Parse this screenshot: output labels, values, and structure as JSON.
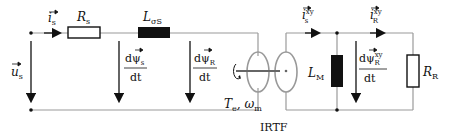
{
  "diagram": {
    "type": "equivalent-circuit",
    "labels": {
      "stator_current": "i",
      "stator_current_sub": "s",
      "stator_resistance": "R",
      "stator_resistance_sub": "s",
      "leakage_inductance": "L",
      "leakage_inductance_sub": "σS",
      "stator_voltage": "u",
      "stator_voltage_sub": "s",
      "dpsi_s_num": "dψ",
      "dpsi_s_sub": "s",
      "dpsi_R_num": "dψ",
      "dpsi_R_sub": "R",
      "dt": "dt",
      "torque": "T",
      "torque_sub": "e",
      "omega": "ω",
      "omega_sub": "m",
      "irtf": "IRTF",
      "i_s_xy": "i",
      "i_s_xy_sub": "s",
      "i_s_xy_sup": "xy",
      "i_R_xy": "i",
      "i_R_xy_sub": "R",
      "i_R_xy_sup": "xy",
      "magnetizing_inductance": "L",
      "magnetizing_inductance_sub": "M",
      "dpsi_R_xy_num": "dψ",
      "dpsi_R_xy_sub": "R",
      "dpsi_R_xy_sup": "xy",
      "rotor_resistance": "R",
      "rotor_resistance_sub": "R"
    }
  }
}
